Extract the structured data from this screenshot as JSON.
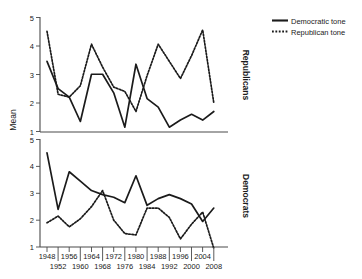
{
  "figure": {
    "ylabel": "Mean",
    "legend": [
      {
        "label": "Democratic tone",
        "style": "solid",
        "color": "#1b1b1b"
      },
      {
        "label": "Republican tone",
        "style": "dotted",
        "color": "#1b1b1b"
      }
    ],
    "panels": [
      {
        "name": "Republicans"
      },
      {
        "name": "Democrats"
      }
    ]
  },
  "chart_data": {
    "type": "line",
    "title": "",
    "xlabel": "",
    "ylabel": "Mean",
    "ylim": [
      1,
      5
    ],
    "yticks": [
      1,
      2,
      3,
      4,
      5
    ],
    "grid": false,
    "legend_position": "top-right",
    "x": [
      1948,
      1952,
      1956,
      1960,
      1964,
      1968,
      1972,
      1976,
      1980,
      1984,
      1988,
      1992,
      1996,
      2000,
      2004,
      2008
    ],
    "xtick_labels_row1": [
      "1948",
      "1956",
      "1964",
      "1972",
      "1980",
      "1988",
      "1996",
      "2004"
    ],
    "xtick_labels_row2": [
      "1952",
      "1960",
      "1968",
      "1976",
      "1984",
      "1992",
      "2000",
      "2008"
    ],
    "panels": [
      {
        "name": "Republicans",
        "series": [
          {
            "name": "Democratic tone",
            "style": "solid",
            "values": [
              3.45,
              2.5,
              2.2,
              1.35,
              3.0,
              3.0,
              2.35,
              1.15,
              3.35,
              2.15,
              1.85,
              1.15,
              1.4,
              1.6,
              1.4,
              1.7
            ]
          },
          {
            "name": "Republican tone",
            "style": "dotted",
            "values": [
              4.5,
              2.3,
              2.2,
              2.6,
              4.05,
              3.25,
              2.55,
              2.4,
              1.7,
              2.95,
              4.05,
              3.45,
              2.85,
              3.65,
              4.55,
              2.0
            ]
          }
        ]
      },
      {
        "name": "Democrats",
        "series": [
          {
            "name": "Democratic tone",
            "style": "solid",
            "values": [
              4.5,
              2.4,
              3.8,
              3.45,
              3.1,
              2.95,
              2.85,
              2.65,
              3.65,
              2.55,
              2.8,
              2.95,
              2.8,
              2.6,
              1.95,
              2.45
            ]
          },
          {
            "name": "Republican tone",
            "style": "dotted",
            "values": [
              1.9,
              2.15,
              1.75,
              2.05,
              2.5,
              3.1,
              2.0,
              1.5,
              1.45,
              2.45,
              2.45,
              2.1,
              1.3,
              1.85,
              2.3,
              0.95
            ]
          }
        ]
      }
    ]
  }
}
